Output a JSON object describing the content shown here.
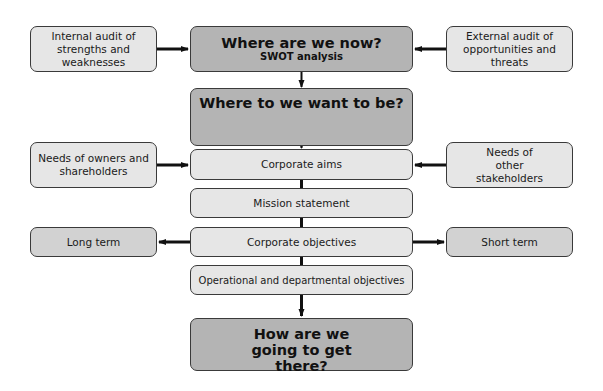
{
  "diagram": {
    "nodes": {
      "internal_audit": "Internal audit of strengths and weaknesses",
      "where_now": "Where are we now?",
      "where_now_sub": "SWOT analysis",
      "external_audit": "External audit of opportunities and threats",
      "where_want": "Where to we want to be?",
      "owners": "Needs of owners and shareholders",
      "corporate_aims": "Corporate aims",
      "other_stakeholders": "Needs of other stakeholders",
      "mission": "Mission statement",
      "long_term": "Long term",
      "corporate_objectives": "Corporate objectives",
      "short_term": "Short term",
      "operational": "Operational and departmental objectives",
      "how_get_there": "How are we going to get there?"
    },
    "edges": [
      {
        "from": "internal_audit",
        "to": "where_now"
      },
      {
        "from": "external_audit",
        "to": "where_now"
      },
      {
        "from": "where_now",
        "to": "where_want"
      },
      {
        "from": "where_want",
        "to": "corporate_aims"
      },
      {
        "from": "owners",
        "to": "corporate_aims"
      },
      {
        "from": "other_stakeholders",
        "to": "corporate_aims"
      },
      {
        "from": "corporate_aims",
        "to": "mission"
      },
      {
        "from": "mission",
        "to": "corporate_objectives"
      },
      {
        "from": "corporate_objectives",
        "to": "long_term"
      },
      {
        "from": "corporate_objectives",
        "to": "short_term"
      },
      {
        "from": "corporate_objectives",
        "to": "operational"
      },
      {
        "from": "operational",
        "to": "how_get_there"
      }
    ],
    "colors": {
      "light_fill": "#e6e6e6",
      "mid_fill": "#d2d2d2",
      "dark_fill": "#b4b4b4",
      "border": "#3a3a3a",
      "arrow": "#111111"
    }
  }
}
